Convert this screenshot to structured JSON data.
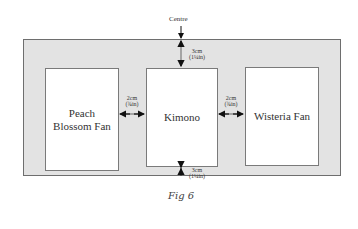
{
  "diagram": {
    "centre_label": "Centre",
    "frames": [
      {
        "label": "Peach Blossom Fan"
      },
      {
        "label": "Kimono"
      },
      {
        "label": "Wisteria Fan"
      }
    ],
    "dimensions": {
      "top": {
        "metric": "3cm",
        "imperial": "(1¼in)"
      },
      "bottom": {
        "metric": "3cm",
        "imperial": "(1¼in)"
      },
      "left_gap": {
        "metric": "2cm",
        "imperial": "(¾in)"
      },
      "right_gap": {
        "metric": "2cm",
        "imperial": "(¾in)"
      }
    },
    "caption": "Fig 6",
    "colors": {
      "panel": "#e3e3e3",
      "frame": "#ffffff",
      "border": "#6e6e6e",
      "arrow": "#111111"
    }
  }
}
